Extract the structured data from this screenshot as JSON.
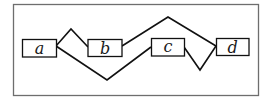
{
  "diagram": {
    "frame": {
      "x": 13,
      "y": 4,
      "w": 245,
      "h": 91,
      "color": "#6e6e6e"
    },
    "nodes": [
      {
        "id": "a",
        "label": "a",
        "x": 22,
        "y": 39,
        "w": 34,
        "h": 18
      },
      {
        "id": "b",
        "label": "b",
        "x": 88,
        "y": 39,
        "w": 34,
        "h": 17
      },
      {
        "id": "c",
        "label": "c",
        "x": 151,
        "y": 38,
        "w": 33,
        "h": 18
      },
      {
        "id": "d",
        "label": "d",
        "x": 216,
        "y": 38,
        "w": 33,
        "h": 17
      }
    ],
    "edges": [
      {
        "from": "a",
        "to": "b",
        "path": "56,46 71,29 88,47"
      },
      {
        "from": "a",
        "to": "c",
        "path": "56,46 107,80 151,47"
      },
      {
        "from": "b",
        "to": "d",
        "path": "122,46 168,17 216,46"
      },
      {
        "from": "c",
        "to": "d",
        "path": "184,47 200,70 216,46"
      }
    ],
    "line_color": "#111111"
  }
}
